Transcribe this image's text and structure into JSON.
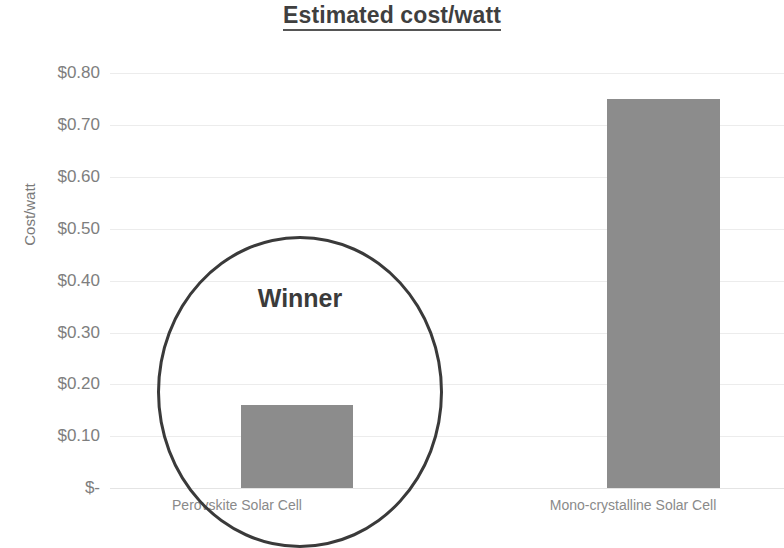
{
  "chart_data": {
    "type": "bar",
    "title": "Estimated cost/watt",
    "xlabel": "",
    "ylabel": "Cost/watt",
    "categories": [
      "Perovskite Solar Cell",
      "Mono-crystalline Solar Cell"
    ],
    "values": [
      0.16,
      0.75
    ],
    "ylim": [
      0,
      0.8
    ],
    "ytick_values": [
      0.8,
      0.7,
      0.6,
      0.5,
      0.4,
      0.3,
      0.2,
      0.1,
      0
    ],
    "ytick_labels": [
      "$0.80",
      "$0.70",
      "$0.60",
      "$0.50",
      "$0.40",
      "$0.30",
      "$0.20",
      "$0.10",
      "$-"
    ],
    "grid": true,
    "legend": false,
    "legend_position": "none",
    "annotations": [
      {
        "text": "Winner",
        "shape": "ellipse",
        "target_category": "Perovskite Solar Cell"
      }
    ],
    "series": [
      {
        "name": "Estimated cost/watt",
        "values": [
          0.16,
          0.75
        ],
        "color": "#8c8c8c"
      }
    ],
    "colors": {
      "bar": "#8c8c8c",
      "gridline": "#ececec",
      "tick_text": "#7e7e7e",
      "title_text": "#3f3f3f",
      "annotation": "#3a3a3a"
    }
  }
}
